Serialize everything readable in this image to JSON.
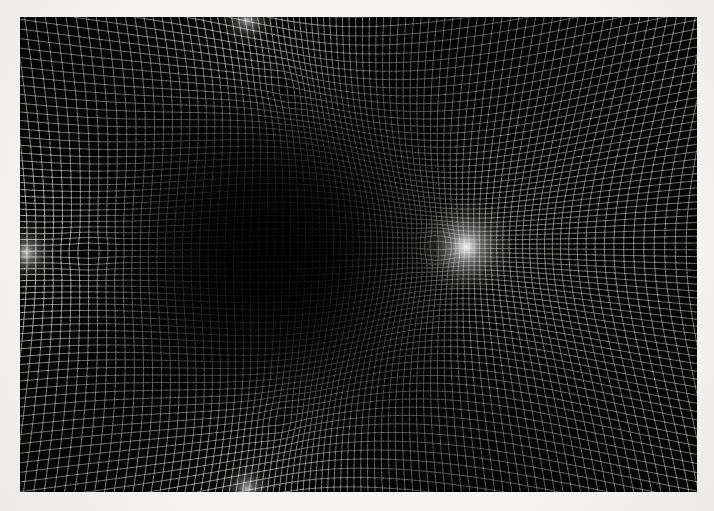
{
  "image": {
    "title": "Warped grid moire field",
    "description": "Photographic plate of a white rectangular grid optically warped toward four convergence points",
    "width": 714,
    "height": 511,
    "background_color": "#f4f3f0",
    "plate_color": "#050505",
    "line_color": "#d8d8d4"
  },
  "plate": {
    "x": 20,
    "y": 17,
    "width": 677,
    "height": 475
  },
  "grid": {
    "base_cell_px": 9.0,
    "columns": 96,
    "rows": 68,
    "line_width": 0.85,
    "line_color": "#e2e2de",
    "line_opacity": 0.92,
    "samples_per_line": 150
  },
  "focal_points": [
    {
      "name": "primary-interior-focus",
      "x": 466,
      "y": 247,
      "strength": 0.62,
      "radius": 250,
      "glow_radius": 46,
      "glow_intensity": 0.95
    },
    {
      "name": "left-edge-focus",
      "x": 26,
      "y": 253,
      "strength": 0.4,
      "radius": 185,
      "glow_radius": 30,
      "glow_intensity": 0.7
    },
    {
      "name": "top-edge-focus",
      "x": 247,
      "y": 19,
      "strength": 0.38,
      "radius": 180,
      "glow_radius": 26,
      "glow_intensity": 0.66
    },
    {
      "name": "bottom-edge-focus",
      "x": 247,
      "y": 489,
      "strength": 0.38,
      "radius": 180,
      "glow_radius": 26,
      "glow_intensity": 0.66
    }
  ],
  "brightness_field": {
    "saddle_center_x": 300,
    "saddle_center_y": 250,
    "saddle_radius": 190,
    "saddle_darkness": 0.55,
    "corner_brightness": 0.95,
    "edge_falloff": 0.35
  }
}
